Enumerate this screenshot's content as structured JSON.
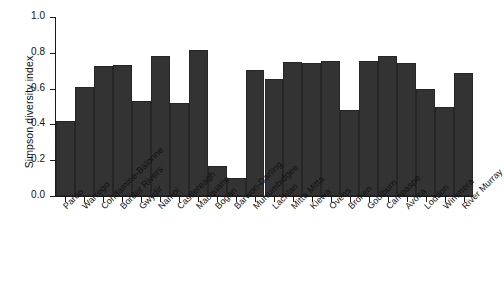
{
  "chart_data": {
    "type": "bar",
    "title": "",
    "xlabel": "",
    "ylabel": "Simpson diversity index",
    "ylim": [
      0,
      1.0
    ],
    "ytick_labels": [
      "0.0",
      "0.2",
      "0.4",
      "0.6",
      "0.8",
      "1.0"
    ],
    "ytick_values": [
      0.0,
      0.2,
      0.4,
      0.6,
      0.8,
      1.0
    ],
    "grid": false,
    "legend": false,
    "bar_color": "#333333",
    "categories": [
      "Paroo",
      "Warrego",
      "Condamine-Balonne",
      "Border Rivers",
      "Gwydir",
      "Namoi",
      "Castlereagh",
      "Macquarie",
      "Bogan",
      "Barwon-Darling",
      "Murrumbidgee",
      "Lachlan",
      "Mitta Mitta",
      "Kiewa",
      "Ovens",
      "Broken",
      "Goulburn",
      "Campaspe",
      "Avoca",
      "Loddon",
      "Wimmera",
      "River Murray"
    ],
    "values": [
      0.42,
      0.61,
      0.725,
      0.73,
      0.53,
      0.78,
      0.52,
      0.815,
      0.165,
      0.1,
      0.705,
      0.655,
      0.75,
      0.745,
      0.755,
      0.48,
      0.755,
      0.785,
      0.745,
      0.6,
      0.5,
      0.69
    ]
  }
}
